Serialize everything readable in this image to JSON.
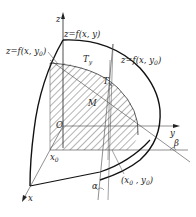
{
  "diagram": {
    "labels": {
      "z_axis": "z",
      "y_axis": "y",
      "x_axis": "x",
      "surface": "z=f(x, y)",
      "curve_y0": "z=f(x, y0)",
      "curve_x0": "z=f(x, y0)",
      "tangent_y": "Ty",
      "tangent_x": "Tx",
      "point_m": "M",
      "origin": "O",
      "x0": "x0",
      "point_xy": "(x0 , y0)",
      "alpha": "α",
      "beta": "β"
    },
    "colors": {
      "line": "#222222",
      "thin_line": "#444444",
      "hatch": "#444444",
      "background": "#ffffff"
    }
  }
}
